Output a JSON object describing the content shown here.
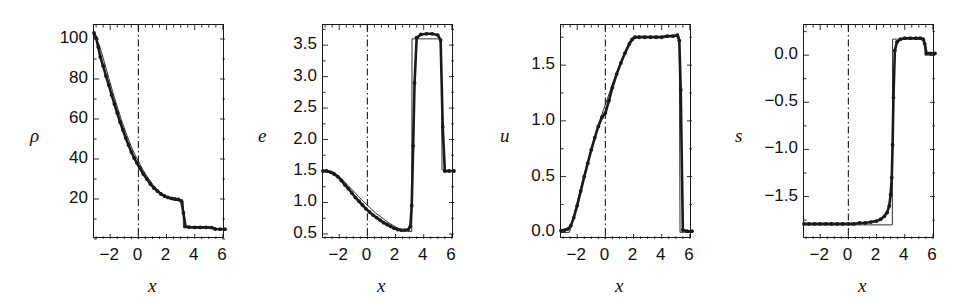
{
  "figure": {
    "kind": "multi-panel-line-plot",
    "panel_count": 4,
    "background_color": "#ffffff",
    "line_color": "#1a1a1a",
    "marker_color": "#1a1a1a",
    "reference_line_style": "dash-dot",
    "reference_line_x": 0
  },
  "chart_data": [
    {
      "type": "line",
      "title": "",
      "xlabel": "x",
      "ylabel": "ρ",
      "xlim": [
        -3.15,
        6.15
      ],
      "ylim": [
        0,
        107
      ],
      "xticks": [
        -2,
        0,
        2,
        4,
        6
      ],
      "xticklabels": [
        "−2",
        "0",
        "2",
        "4",
        "6"
      ],
      "yticks": [
        20,
        40,
        60,
        80,
        100
      ],
      "yticklabels": [
        "20",
        "40",
        "60",
        "80",
        "100"
      ],
      "grid": false,
      "legend": "none",
      "annotations": [
        "vertical dash-dot reference line at x = 0"
      ],
      "series": [
        {
          "name": "exact solution",
          "style": "thin-solid",
          "x": [
            -3.15,
            -3.0,
            -2.8,
            -2.6,
            -2.4,
            -2.2,
            -2.0,
            -1.8,
            -1.6,
            -1.4,
            -1.2,
            -1.0,
            -0.8,
            -0.6,
            -0.4,
            -0.2,
            0.0,
            0.25,
            0.5,
            0.75,
            1.0,
            1.25,
            1.5,
            1.75,
            2.0,
            2.25,
            2.5,
            2.75,
            3.0,
            3.18,
            3.2,
            3.6,
            4.0,
            4.5,
            5.0,
            5.3,
            5.32,
            5.6,
            6.15
          ],
          "y": [
            103,
            100,
            97.5,
            93.0,
            88.0,
            83.0,
            78.0,
            73.0,
            68.5,
            64.0,
            59.5,
            55.5,
            51.5,
            48.0,
            44.5,
            41.5,
            39.0,
            35.5,
            32.5,
            30.0,
            27.5,
            25.5,
            23.5,
            22.0,
            21.0,
            20.0,
            19.5,
            19.2,
            19.0,
            19.0,
            5.8,
            5.7,
            5.7,
            5.6,
            5.6,
            5.6,
            4.8,
            4.8,
            4.8
          ]
        },
        {
          "name": "numerical solution",
          "style": "thick-solid-with-dots",
          "x": [
            -3.15,
            -3.0,
            -2.85,
            -2.7,
            -2.5,
            -2.3,
            -2.1,
            -1.9,
            -1.7,
            -1.5,
            -1.3,
            -1.1,
            -0.9,
            -0.7,
            -0.5,
            -0.3,
            -0.1,
            0.1,
            0.35,
            0.6,
            0.85,
            1.1,
            1.35,
            1.6,
            1.85,
            2.1,
            2.35,
            2.6,
            2.85,
            3.05,
            3.2,
            3.35,
            3.6,
            4.0,
            4.4,
            4.8,
            5.2,
            5.45,
            5.8,
            6.15
          ],
          "y": [
            103,
            100.5,
            96.0,
            91.0,
            86.5,
            81.5,
            77.0,
            72.0,
            67.5,
            63.0,
            58.5,
            54.5,
            50.5,
            47.0,
            43.5,
            40.5,
            38.0,
            35.5,
            32.5,
            30.0,
            27.5,
            25.5,
            24.0,
            22.5,
            21.5,
            20.8,
            20.3,
            20.0,
            19.8,
            19.0,
            13.0,
            6.2,
            5.9,
            5.8,
            5.8,
            5.8,
            5.7,
            5.0,
            4.9,
            4.9
          ]
        }
      ]
    },
    {
      "type": "line",
      "title": "",
      "xlabel": "x",
      "ylabel": "e",
      "xlim": [
        -3.15,
        6.15
      ],
      "ylim": [
        0.42,
        3.82
      ],
      "xticks": [
        -2,
        0,
        2,
        4,
        6
      ],
      "xticklabels": [
        "−2",
        "0",
        "2",
        "4",
        "6"
      ],
      "yticks": [
        0.5,
        1.0,
        1.5,
        2.0,
        2.5,
        3.0,
        3.5
      ],
      "yticklabels": [
        "0.5",
        "1.0",
        "1.5",
        "2.0",
        "2.5",
        "3.0",
        "3.5"
      ],
      "grid": false,
      "legend": "none",
      "annotations": [
        "vertical dash-dot reference line at x = 0"
      ],
      "series": [
        {
          "name": "exact solution",
          "style": "thin-solid",
          "x": [
            -3.15,
            -2.8,
            -2.5,
            -2.3,
            -2.1,
            -1.8,
            -1.5,
            -1.2,
            -0.9,
            -0.6,
            -0.3,
            0.0,
            0.3,
            0.6,
            0.9,
            1.2,
            1.5,
            1.8,
            2.1,
            2.4,
            2.7,
            3.0,
            3.15,
            3.17,
            3.4,
            3.8,
            4.2,
            4.6,
            5.0,
            5.25,
            5.3,
            5.6,
            6.15
          ],
          "y": [
            1.5,
            1.5,
            1.49,
            1.47,
            1.43,
            1.37,
            1.3,
            1.23,
            1.16,
            1.09,
            1.02,
            0.96,
            0.89,
            0.83,
            0.78,
            0.73,
            0.68,
            0.64,
            0.6,
            0.57,
            0.55,
            0.54,
            0.54,
            3.6,
            3.6,
            3.6,
            3.6,
            3.6,
            3.6,
            3.6,
            1.52,
            1.5,
            1.5
          ]
        },
        {
          "name": "numerical solution",
          "style": "thick-solid-with-dots",
          "x": [
            -3.15,
            -2.9,
            -2.6,
            -2.35,
            -2.1,
            -1.85,
            -1.6,
            -1.35,
            -1.1,
            -0.85,
            -0.6,
            -0.35,
            -0.1,
            0.15,
            0.4,
            0.65,
            0.9,
            1.15,
            1.4,
            1.65,
            1.9,
            2.15,
            2.4,
            2.65,
            2.9,
            3.05,
            3.15,
            3.25,
            3.35,
            3.5,
            3.8,
            4.2,
            4.6,
            5.0,
            5.2,
            5.35,
            5.5,
            5.8,
            6.15
          ],
          "y": [
            1.5,
            1.5,
            1.48,
            1.45,
            1.41,
            1.35,
            1.28,
            1.22,
            1.15,
            1.08,
            1.02,
            0.96,
            0.9,
            0.85,
            0.8,
            0.76,
            0.72,
            0.68,
            0.65,
            0.62,
            0.59,
            0.57,
            0.56,
            0.56,
            0.57,
            0.62,
            0.95,
            1.9,
            2.9,
            3.62,
            3.67,
            3.68,
            3.68,
            3.66,
            3.58,
            2.2,
            1.5,
            1.5,
            1.5
          ]
        }
      ]
    },
    {
      "type": "line",
      "title": "",
      "xlabel": "x",
      "ylabel": "u",
      "xlim": [
        -3.15,
        6.15
      ],
      "ylim": [
        -0.06,
        1.86
      ],
      "xticks": [
        -2,
        0,
        2,
        4,
        6
      ],
      "xticklabels": [
        "−2",
        "0",
        "2",
        "4",
        "6"
      ],
      "yticks": [
        0.0,
        0.5,
        1.0,
        1.5
      ],
      "yticklabels": [
        "0.0",
        "0.5",
        "1.0",
        "1.5"
      ],
      "grid": false,
      "legend": "none",
      "annotations": [
        "vertical dash-dot reference line at x = 0"
      ],
      "series": [
        {
          "name": "exact solution",
          "style": "thin-solid",
          "x": [
            -3.15,
            -2.8,
            -2.55,
            -2.5,
            -2.2,
            -1.9,
            -1.6,
            -1.3,
            -1.0,
            -0.7,
            -0.4,
            -0.1,
            0.2,
            0.5,
            0.8,
            1.1,
            1.4,
            1.7,
            1.95,
            2.1,
            2.5,
            3.0,
            3.5,
            4.0,
            4.5,
            5.0,
            5.25,
            5.3,
            5.6,
            6.15
          ],
          "y": [
            0.0,
            0.0,
            0.0,
            0.02,
            0.17,
            0.32,
            0.47,
            0.61,
            0.75,
            0.88,
            1.0,
            1.11,
            1.22,
            1.33,
            1.43,
            1.53,
            1.62,
            1.7,
            1.75,
            1.76,
            1.76,
            1.76,
            1.76,
            1.76,
            1.76,
            1.76,
            1.76,
            0.0,
            0.0,
            0.0
          ]
        },
        {
          "name": "numerical solution",
          "style": "thick-solid-with-dots",
          "x": [
            -3.15,
            -2.9,
            -2.65,
            -2.45,
            -2.25,
            -2.0,
            -1.75,
            -1.5,
            -1.25,
            -1.0,
            -0.75,
            -0.5,
            -0.25,
            0.0,
            0.25,
            0.5,
            0.8,
            1.1,
            1.4,
            1.7,
            1.9,
            2.1,
            2.4,
            2.8,
            3.2,
            3.6,
            4.0,
            4.4,
            4.8,
            5.1,
            5.25,
            5.35,
            5.5,
            5.8,
            6.15
          ],
          "y": [
            0.015,
            0.02,
            0.03,
            0.06,
            0.13,
            0.24,
            0.37,
            0.5,
            0.62,
            0.74,
            0.85,
            0.95,
            1.03,
            1.07,
            1.18,
            1.3,
            1.42,
            1.52,
            1.61,
            1.69,
            1.73,
            1.75,
            1.75,
            1.75,
            1.75,
            1.75,
            1.75,
            1.76,
            1.76,
            1.77,
            1.72,
            1.28,
            0.02,
            0.01,
            0.01
          ]
        }
      ]
    },
    {
      "type": "line",
      "title": "",
      "xlabel": "x",
      "ylabel": "s",
      "xlim": [
        -3.15,
        6.15
      ],
      "ylim": [
        -1.95,
        0.32
      ],
      "xticks": [
        -2,
        0,
        2,
        4,
        6
      ],
      "xticklabels": [
        "−2",
        "0",
        "2",
        "4",
        "6"
      ],
      "yticks": [
        -1.5,
        -1.0,
        -0.5,
        0.0
      ],
      "yticklabels": [
        "−1.5",
        "−1.0",
        "−0.5",
        "0.0"
      ],
      "grid": false,
      "legend": "none",
      "annotations": [
        "vertical dash-dot reference line at x = 0"
      ],
      "series": [
        {
          "name": "exact solution",
          "style": "thin-solid",
          "x": [
            -3.15,
            -2.5,
            -2.0,
            -1.5,
            -1.0,
            -0.5,
            0.0,
            0.5,
            1.0,
            1.5,
            2.0,
            2.5,
            3.0,
            3.12,
            3.14,
            3.4,
            3.8,
            4.2,
            4.6,
            5.0,
            5.3,
            5.42,
            5.44,
            5.8,
            6.15
          ],
          "y": [
            -1.8,
            -1.8,
            -1.8,
            -1.8,
            -1.8,
            -1.8,
            -1.8,
            -1.8,
            -1.8,
            -1.8,
            -1.8,
            -1.8,
            -1.8,
            -1.8,
            0.17,
            0.17,
            0.17,
            0.17,
            0.17,
            0.17,
            0.17,
            0.17,
            0.0,
            0.0,
            0.0
          ]
        },
        {
          "name": "numerical solution",
          "style": "thick-solid-with-dots",
          "x": [
            -3.15,
            -2.8,
            -2.4,
            -2.0,
            -1.6,
            -1.2,
            -0.8,
            -0.4,
            0.0,
            0.4,
            0.8,
            1.2,
            1.6,
            2.0,
            2.3,
            2.55,
            2.75,
            2.9,
            3.0,
            3.08,
            3.14,
            3.2,
            3.3,
            3.45,
            3.7,
            4.0,
            4.4,
            4.8,
            5.1,
            5.3,
            5.42,
            5.55,
            5.8,
            6.15
          ],
          "y": [
            -1.79,
            -1.79,
            -1.79,
            -1.79,
            -1.79,
            -1.79,
            -1.79,
            -1.79,
            -1.79,
            -1.79,
            -1.78,
            -1.78,
            -1.77,
            -1.76,
            -1.74,
            -1.71,
            -1.67,
            -1.6,
            -1.48,
            -1.3,
            -0.95,
            -0.45,
            0.05,
            0.14,
            0.17,
            0.18,
            0.18,
            0.18,
            0.18,
            0.17,
            0.12,
            0.02,
            0.02,
            0.02
          ]
        }
      ]
    }
  ]
}
